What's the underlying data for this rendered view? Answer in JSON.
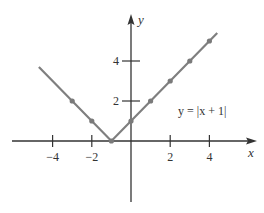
{
  "chart_data": {
    "type": "line",
    "title": "",
    "xlabel": "x",
    "ylabel": "y",
    "annotation": "y = |x + 1|",
    "function": "y = |x + 1|",
    "x_ticks": [
      -4,
      -2,
      2,
      4
    ],
    "x_tick_labels": [
      "−4",
      "−2",
      "2",
      "4"
    ],
    "y_ticks": [
      2,
      4
    ],
    "y_tick_labels": [
      "2",
      "4"
    ],
    "xlim": [
      -6.1,
      6.4
    ],
    "ylim": [
      -3.1,
      6.3
    ],
    "grid": false,
    "legend": "none",
    "series": [
      {
        "name": "y = |x + 1|",
        "line_start": {
          "x": -4.7,
          "y": 3.7
        },
        "line_end": {
          "x": 4.4,
          "y": 5.4
        },
        "points": [
          {
            "x": -3,
            "y": 2
          },
          {
            "x": -2,
            "y": 1
          },
          {
            "x": -1,
            "y": 0
          },
          {
            "x": 0,
            "y": 1
          },
          {
            "x": 1,
            "y": 2
          },
          {
            "x": 2,
            "y": 3
          },
          {
            "x": 3,
            "y": 4
          },
          {
            "x": 4,
            "y": 5
          }
        ],
        "color": "#7f7f7f",
        "marker_color": "#7a7a7a"
      }
    ],
    "axis_color": "#333333"
  }
}
